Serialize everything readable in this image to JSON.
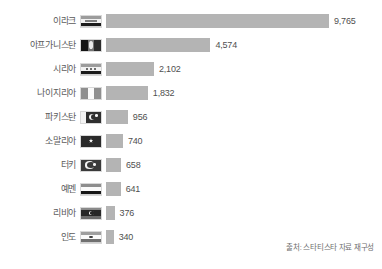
{
  "chart_data": {
    "type": "bar",
    "orientation": "horizontal",
    "title": "",
    "subtitle": "",
    "xlabel": "",
    "ylabel": "",
    "grid": false,
    "legend": null,
    "xlim": [
      0,
      9765
    ],
    "categories": [
      "이라크",
      "아프가니스탄",
      "시리아",
      "나이지리아",
      "파키스탄",
      "소말리아",
      "터키",
      "예멘",
      "리비아",
      "인도"
    ],
    "values": [
      9765,
      4574,
      2102,
      1832,
      956,
      740,
      658,
      641,
      376,
      340
    ],
    "value_labels": [
      "9,765",
      "4,574",
      "2,102",
      "1,832",
      "956",
      "740",
      "658",
      "641",
      "376",
      "340"
    ],
    "bar_color": "#b4b4b4",
    "label_color": "#5b5b5b",
    "rows": [
      {
        "label": "이라크",
        "value": 9765,
        "value_label": "9,765",
        "flag": "flag-iraq"
      },
      {
        "label": "아프가니스탄",
        "value": 4574,
        "value_label": "4,574",
        "flag": "flag-afghanistan"
      },
      {
        "label": "시리아",
        "value": 2102,
        "value_label": "2,102",
        "flag": "flag-syria"
      },
      {
        "label": "나이지리아",
        "value": 1832,
        "value_label": "1,832",
        "flag": "flag-nigeria"
      },
      {
        "label": "파키스탄",
        "value": 956,
        "value_label": "956",
        "flag": "flag-pakistan"
      },
      {
        "label": "소말리아",
        "value": 740,
        "value_label": "740",
        "flag": "flag-somalia"
      },
      {
        "label": "터키",
        "value": 658,
        "value_label": "658",
        "flag": "flag-turkey"
      },
      {
        "label": "예멘",
        "value": 641,
        "value_label": "641",
        "flag": "flag-yemen"
      },
      {
        "label": "리비아",
        "value": 376,
        "value_label": "376",
        "flag": "flag-libya"
      },
      {
        "label": "인도",
        "value": 340,
        "value_label": "340",
        "flag": "flag-india"
      }
    ]
  },
  "footer": {
    "source": "출처: 스타티스타 자료 재구성"
  }
}
